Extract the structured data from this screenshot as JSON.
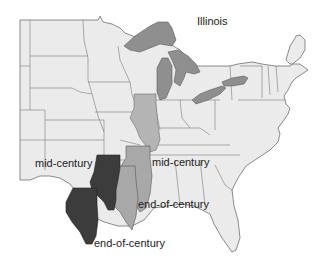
{
  "title": "Illinois",
  "labels": [
    {
      "id": "mid-century-dark",
      "text": "mid-century"
    },
    {
      "id": "mid-century-light",
      "text": "mid-century"
    },
    {
      "id": "end-of-century-light",
      "text": "end-of-century"
    },
    {
      "id": "end-of-century-dark",
      "text": "end-of-century"
    }
  ],
  "colors": {
    "land": "#ebebeb",
    "border": "#6e6e6e",
    "lakes": "#8f8f8f",
    "illinois_current": "#b4b4b4",
    "light_scenario": "#a8a8a8",
    "dark_scenario": "#3c3c3c"
  },
  "legend_meaning": {
    "light_gray": "lower-emissions scenario",
    "dark_gray": "higher-emissions scenario"
  }
}
